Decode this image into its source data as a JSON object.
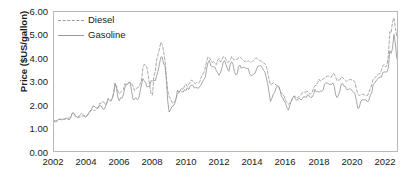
{
  "chart_data": {
    "type": "line",
    "title": "",
    "xlabel": "",
    "ylabel": "Price ($US/gallon)",
    "xlim": [
      2002,
      2022.6
    ],
    "ylim": [
      0,
      6
    ],
    "grid": false,
    "legend_position": "top-left",
    "ytick_labels": [
      "0.00",
      "1.00",
      "2.00",
      "3.00",
      "4.00",
      "5.00",
      "6.00"
    ],
    "ytick_values": [
      0,
      1,
      2,
      3,
      4,
      5,
      6
    ],
    "xtick_labels": [
      "2002",
      "2004",
      "2006",
      "2008",
      "2010",
      "2012",
      "2014",
      "2016",
      "2018",
      "2020",
      "2022"
    ],
    "xtick_values": [
      2002,
      2004,
      2006,
      2008,
      2010,
      2012,
      2014,
      2016,
      2018,
      2020,
      2022
    ],
    "x_start": 2002.0,
    "x_step": 0.08333,
    "series": [
      {
        "name": "Diesel",
        "style": "dashed",
        "color": "#a0a0a0",
        "values": [
          1.32,
          1.3,
          1.31,
          1.36,
          1.36,
          1.35,
          1.34,
          1.36,
          1.38,
          1.4,
          1.42,
          1.43,
          1.48,
          1.63,
          1.66,
          1.53,
          1.47,
          1.45,
          1.45,
          1.47,
          1.5,
          1.52,
          1.52,
          1.5,
          1.53,
          1.61,
          1.69,
          1.78,
          1.79,
          1.73,
          1.76,
          1.82,
          1.9,
          2.07,
          2.06,
          2.14,
          2.11,
          2.0,
          2.09,
          2.27,
          2.2,
          2.17,
          2.27,
          2.51,
          2.91,
          2.8,
          2.59,
          2.47,
          2.53,
          2.58,
          2.65,
          2.9,
          2.88,
          2.9,
          2.96,
          2.97,
          2.91,
          2.79,
          2.61,
          2.68,
          2.73,
          2.76,
          2.88,
          3.0,
          3.56,
          3.74,
          3.71,
          3.6,
          3.24,
          2.81,
          2.47,
          2.42,
          3.22,
          3.45,
          3.94,
          4.18,
          4.4,
          4.7,
          4.6,
          4.3,
          3.9,
          3.2,
          2.6,
          2.35,
          2.25,
          2.1,
          2.05,
          2.13,
          2.26,
          2.46,
          2.51,
          2.63,
          2.7,
          2.65,
          2.8,
          2.9,
          2.79,
          2.86,
          2.95,
          3.06,
          3.03,
          2.95,
          2.91,
          2.96,
          2.93,
          2.97,
          3.18,
          3.29,
          3.39,
          3.58,
          3.88,
          4.07,
          4.02,
          3.92,
          3.83,
          3.84,
          3.8,
          3.73,
          3.93,
          3.99,
          3.84,
          3.94,
          4.07,
          4.06,
          3.95,
          3.83,
          3.85,
          3.91,
          4.08,
          3.99,
          3.93,
          3.95,
          3.94,
          4.04,
          4.07,
          4.01,
          3.93,
          3.87,
          3.88,
          3.85,
          3.9,
          3.85,
          3.82,
          3.86,
          3.91,
          4.0,
          4.01,
          3.96,
          3.91,
          3.89,
          3.86,
          3.79,
          3.77,
          3.66,
          3.4,
          3.1,
          2.86,
          2.88,
          2.95,
          2.9,
          2.85,
          2.83,
          2.76,
          2.58,
          2.49,
          2.45,
          2.34,
          2.17,
          2.09,
          2.02,
          2.06,
          2.19,
          2.27,
          2.38,
          2.35,
          2.28,
          2.31,
          2.38,
          2.42,
          2.52,
          2.53,
          2.54,
          2.56,
          2.57,
          2.49,
          2.46,
          2.52,
          2.72,
          2.82,
          2.83,
          2.95,
          3.1,
          3.02,
          3.05,
          3.11,
          3.14,
          3.2,
          3.23,
          3.23,
          3.18,
          3.2,
          3.34,
          3.33,
          3.18,
          3.03,
          3.06,
          3.07,
          3.2,
          3.17,
          3.12,
          3.05,
          3.0,
          3.05,
          3.08,
          3.09,
          3.04,
          3.04,
          2.95,
          2.66,
          2.45,
          2.39,
          2.43,
          2.46,
          2.43,
          2.42,
          2.39,
          2.4,
          2.55,
          2.7,
          2.85,
          3.1,
          3.15,
          3.2,
          3.29,
          3.32,
          3.34,
          3.49,
          3.68,
          3.73,
          3.62,
          3.73,
          4.11,
          5.15,
          5.1,
          5.57,
          5.75,
          5.3,
          4.95,
          5.05,
          5.2,
          5.35,
          4.8
        ]
      },
      {
        "name": "Gasoline",
        "style": "solid",
        "color": "#9c9c9c",
        "values": [
          1.3,
          1.25,
          1.27,
          1.36,
          1.38,
          1.37,
          1.36,
          1.38,
          1.39,
          1.42,
          1.37,
          1.34,
          1.43,
          1.58,
          1.65,
          1.57,
          1.48,
          1.46,
          1.49,
          1.58,
          1.62,
          1.56,
          1.5,
          1.46,
          1.55,
          1.64,
          1.73,
          1.78,
          1.94,
          1.93,
          1.88,
          1.85,
          1.86,
          1.98,
          1.94,
          1.84,
          1.8,
          1.9,
          2.06,
          2.24,
          2.19,
          2.15,
          2.28,
          2.49,
          2.93,
          2.73,
          2.33,
          2.17,
          2.3,
          2.28,
          2.42,
          2.72,
          2.88,
          2.87,
          2.97,
          2.94,
          2.56,
          2.23,
          2.22,
          2.3,
          2.22,
          2.26,
          2.55,
          2.84,
          3.12,
          3.03,
          2.95,
          2.77,
          2.78,
          2.78,
          3.04,
          3.02,
          3.04,
          3.03,
          3.25,
          3.46,
          3.75,
          4.05,
          4.06,
          3.75,
          3.7,
          3.04,
          2.15,
          1.68,
          1.79,
          1.92,
          1.95,
          2.05,
          2.27,
          2.63,
          2.53,
          2.62,
          2.57,
          2.54,
          2.64,
          2.6,
          2.73,
          2.65,
          2.78,
          2.85,
          2.84,
          2.73,
          2.73,
          2.74,
          2.7,
          2.79,
          2.85,
          2.99,
          3.09,
          3.17,
          3.54,
          3.81,
          3.91,
          3.68,
          3.65,
          3.64,
          3.61,
          3.47,
          3.38,
          3.27,
          3.38,
          3.58,
          3.85,
          3.9,
          3.73,
          3.54,
          3.44,
          3.72,
          3.85,
          3.75,
          3.43,
          3.29,
          3.32,
          3.64,
          3.71,
          3.56,
          3.61,
          3.62,
          3.58,
          3.56,
          3.57,
          3.34,
          3.25,
          3.27,
          3.32,
          3.36,
          3.54,
          3.66,
          3.67,
          3.69,
          3.61,
          3.49,
          3.41,
          3.17,
          2.91,
          2.55,
          2.13,
          2.27,
          2.46,
          2.51,
          2.72,
          2.8,
          2.79,
          2.62,
          2.34,
          2.29,
          2.15,
          2.04,
          1.85,
          1.76,
          1.99,
          2.13,
          2.29,
          2.37,
          2.25,
          2.18,
          2.25,
          2.28,
          2.2,
          2.26,
          2.35,
          2.33,
          2.32,
          2.44,
          2.37,
          2.31,
          2.33,
          2.43,
          2.66,
          2.55,
          2.59,
          2.53,
          2.6,
          2.57,
          2.64,
          2.88,
          2.95,
          2.93,
          2.89,
          2.88,
          2.87,
          2.94,
          2.79,
          2.42,
          2.31,
          2.41,
          2.59,
          2.89,
          2.91,
          2.8,
          2.79,
          2.65,
          2.65,
          2.69,
          2.67,
          2.59,
          2.55,
          2.45,
          2.15,
          1.84,
          1.87,
          2.12,
          2.21,
          2.21,
          2.21,
          2.2,
          2.12,
          2.2,
          2.42,
          2.5,
          2.86,
          2.91,
          3.02,
          3.09,
          3.16,
          3.19,
          3.19,
          3.39,
          3.41,
          3.41,
          3.41,
          3.61,
          4.32,
          4.21,
          4.44,
          5.03,
          4.67,
          4.02,
          3.84,
          3.9,
          3.8,
          3.3
        ]
      }
    ]
  }
}
